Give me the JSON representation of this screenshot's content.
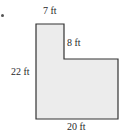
{
  "figure": {
    "bullet": "•",
    "shape": {
      "type": "L-shaped polygon",
      "fill_color": "#ececec",
      "stroke_color": "#333333",
      "points": [
        [
          36,
          24
        ],
        [
          64,
          24
        ],
        [
          64,
          59
        ],
        [
          118,
          59
        ],
        [
          118,
          119
        ],
        [
          36,
          119
        ]
      ]
    },
    "labels": {
      "top_width": "7 ft",
      "notch_height": "8 ft",
      "left_height": "22 ft",
      "bottom_width": "20 ft"
    }
  }
}
